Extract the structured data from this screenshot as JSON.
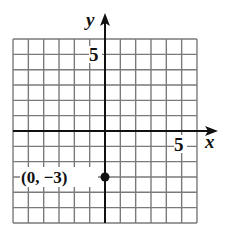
{
  "chart_data": {
    "type": "scatter",
    "title": "",
    "xlabel": "x",
    "ylabel": "y",
    "xlim": [
      -6,
      6
    ],
    "ylim": [
      -6,
      6
    ],
    "grid": true,
    "x_tick_labels": [
      {
        "value": 5,
        "label": "5"
      }
    ],
    "y_tick_labels": [
      {
        "value": 5,
        "label": "5"
      }
    ],
    "series": [
      {
        "name": "point",
        "points": [
          {
            "x": 0,
            "y": -3,
            "label": "(0, −3)"
          }
        ]
      }
    ],
    "annotations": [
      "(0, −3)"
    ]
  },
  "axes": {
    "x_label": "x",
    "y_label": "y",
    "x_tick": "5",
    "y_tick": "5"
  },
  "point": {
    "label": "(0, −3)"
  },
  "colors": {
    "grid": "#7a7a7a",
    "axis": "#111111",
    "point": "#111111",
    "background": "#ffffff"
  }
}
